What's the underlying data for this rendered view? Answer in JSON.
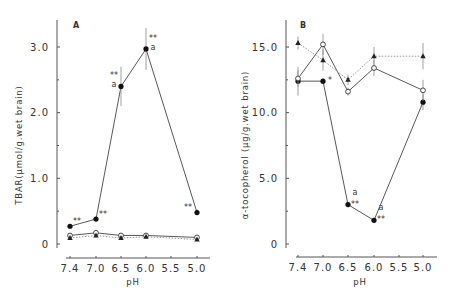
{
  "chart_data": [
    {
      "type": "line",
      "panel_label": "A",
      "title": "",
      "xlabel": "pH",
      "ylabel": "TBAR(μmol/g.wet brain)",
      "x_ticks": [
        "7.4",
        "7.0",
        "6.5",
        "6.0",
        "5.5",
        "5.0"
      ],
      "x_tick_values": [
        7.4,
        7.0,
        6.5,
        6.0,
        5.5,
        5.0
      ],
      "y_ticks": [
        "0",
        "1.0",
        "2.0",
        "3.0"
      ],
      "y_tick_values": [
        0,
        1.0,
        2.0,
        3.0
      ],
      "ylim": [
        0,
        3.3
      ],
      "xlim": [
        7.4,
        5.0
      ],
      "grid": false,
      "series": [
        {
          "name": "filled-circle",
          "marker": "filled-circle",
          "style": "solid",
          "x": [
            7.4,
            7.0,
            6.5,
            6.0,
            5.0
          ],
          "values": [
            0.27,
            0.38,
            2.4,
            2.97,
            0.48
          ],
          "error": [
            0.03,
            0.03,
            0.3,
            0.32,
            0.05
          ],
          "annotations": [
            "**",
            "**",
            "**a",
            "**a",
            "**"
          ]
        },
        {
          "name": "open-circle",
          "marker": "open-circle",
          "style": "solid",
          "x": [
            7.4,
            7.0,
            6.5,
            6.0,
            5.0
          ],
          "values": [
            0.13,
            0.17,
            0.13,
            0.13,
            0.1
          ],
          "error": [
            0.01,
            0.02,
            0.01,
            0.01,
            0.01
          ],
          "annotations": [
            "",
            "",
            "",
            "",
            ""
          ]
        },
        {
          "name": "filled-triangle",
          "marker": "filled-triangle",
          "style": "dotted",
          "x": [
            7.4,
            7.0,
            6.5,
            6.0,
            5.0
          ],
          "values": [
            0.09,
            0.13,
            0.09,
            0.11,
            0.07
          ],
          "error": [
            0.01,
            0.01,
            0.01,
            0.01,
            0.01
          ],
          "annotations": [
            "",
            "",
            "",
            "",
            ""
          ]
        }
      ]
    },
    {
      "type": "line",
      "panel_label": "B",
      "title": "",
      "xlabel": "pH",
      "ylabel": "α-tocopherol (μg/g.wet brain)",
      "x_ticks": [
        "7.4",
        "7.0",
        "6.5",
        "6.0",
        "5.5",
        "5.0"
      ],
      "x_tick_values": [
        7.4,
        7.0,
        6.5,
        6.0,
        5.5,
        5.0
      ],
      "y_ticks": [
        "0",
        "5.0",
        "10.0",
        "15.0"
      ],
      "y_tick_values": [
        0,
        5.0,
        10.0,
        15.0
      ],
      "ylim": [
        0,
        16.5
      ],
      "xlim": [
        7.4,
        5.0
      ],
      "grid": false,
      "series": [
        {
          "name": "filled-circle",
          "marker": "filled-circle",
          "style": "solid",
          "x": [
            7.4,
            7.0,
            6.5,
            6.0,
            5.0
          ],
          "values": [
            12.4,
            12.4,
            3.0,
            1.8,
            10.8
          ],
          "error": [
            1.1,
            0.2,
            0.2,
            0.2,
            0.6
          ],
          "annotations": [
            "",
            "*",
            "**a",
            "**a",
            ""
          ]
        },
        {
          "name": "open-circle",
          "marker": "open-circle",
          "style": "solid",
          "x": [
            7.4,
            7.0,
            6.5,
            6.0,
            5.0
          ],
          "values": [
            12.6,
            15.2,
            11.6,
            13.4,
            11.7
          ],
          "error": [
            0.6,
            0.8,
            0.3,
            0.6,
            0.8
          ],
          "annotations": [
            "",
            "",
            "",
            "",
            ""
          ]
        },
        {
          "name": "filled-triangle",
          "marker": "filled-triangle",
          "style": "dotted",
          "x": [
            7.4,
            7.0,
            6.5,
            6.0,
            5.0
          ],
          "values": [
            15.3,
            14.0,
            12.5,
            14.3,
            14.3
          ],
          "error": [
            0.5,
            0.8,
            0.4,
            0.7,
            1.0
          ],
          "annotations": [
            "",
            "",
            "",
            "",
            ""
          ]
        }
      ]
    }
  ]
}
